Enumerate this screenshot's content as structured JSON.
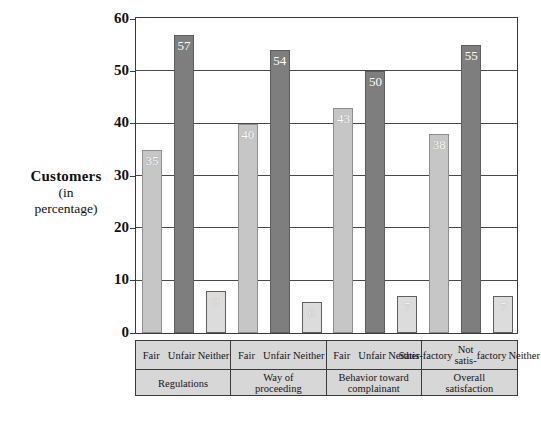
{
  "chart_data": {
    "type": "bar",
    "title": "",
    "ylabel_lines": [
      "Customers",
      "(in",
      "percentage)"
    ],
    "xlabel": "",
    "ylim": [
      0,
      60
    ],
    "yticks": [
      0,
      10,
      20,
      30,
      40,
      50,
      60
    ],
    "grid": true,
    "legend": "none",
    "categories": [
      "Fair",
      "Unfair",
      "Neither",
      "Fair",
      "Unfair",
      "Neither",
      "Fair",
      "Unfair",
      "Neither",
      "Satis-\nfactory",
      "Not satis-\nfactory",
      "Neither"
    ],
    "values": [
      35,
      57,
      8,
      40,
      54,
      6,
      43,
      50,
      7,
      38,
      55,
      7
    ],
    "groups": [
      {
        "name": "Regulations",
        "bars": [
          {
            "label": "Fair",
            "value": 35,
            "style": "light"
          },
          {
            "label": "Unfair",
            "value": 57,
            "style": "dark"
          },
          {
            "label": "Neither",
            "value": 8,
            "style": "pale"
          }
        ]
      },
      {
        "name": "Way of\nproceeding",
        "name_lines": [
          "Way of",
          "proceeding"
        ],
        "bars": [
          {
            "label": "Fair",
            "value": 40,
            "style": "light"
          },
          {
            "label": "Unfair",
            "value": 54,
            "style": "dark"
          },
          {
            "label": "Neither",
            "value": 6,
            "style": "pale"
          }
        ]
      },
      {
        "name": "Behavior toward\ncomplainant",
        "name_lines": [
          "Behavior  toward",
          "complainant"
        ],
        "bars": [
          {
            "label": "Fair",
            "value": 43,
            "style": "light"
          },
          {
            "label": "Unfair",
            "value": 50,
            "style": "dark"
          },
          {
            "label": "Neither",
            "value": 7,
            "style": "pale"
          }
        ]
      },
      {
        "name": "Overall\nsatisfaction",
        "name_lines": [
          "Overall",
          "satisfaction"
        ],
        "bars": [
          {
            "label": "Satis-\nfactory",
            "label_lines": [
              "Satis-",
              "factory"
            ],
            "value": 38,
            "style": "light"
          },
          {
            "label": "Not satis-\nfactory",
            "label_lines": [
              "Not satis-",
              "factory"
            ],
            "value": 55,
            "style": "dark"
          },
          {
            "label": "Neither",
            "label_lines": [
              "Neither"
            ],
            "value": 7,
            "style": "pale"
          }
        ]
      }
    ],
    "colors": {
      "light_bar": "#c6c6c6",
      "dark_bar": "#7e7e7e",
      "pale_bar": "#dcdcdc",
      "axis": "#3a3a3a",
      "gridline": "#4a4a4a",
      "table_fill": "#d7d7d7",
      "value_label": "#ffffff",
      "text": "#111111"
    }
  },
  "axis_title": {
    "line1": "Customers",
    "line2": "(in",
    "line3": "percentage)"
  }
}
